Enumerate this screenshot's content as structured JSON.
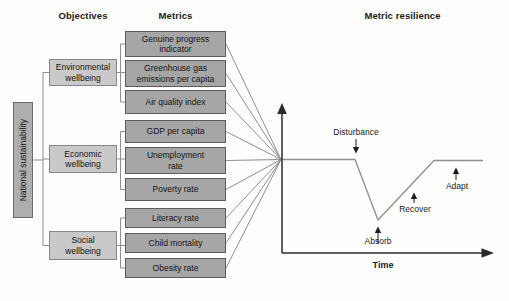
{
  "headers": {
    "objectives": "Objectives",
    "metrics": "Metrics",
    "resilience": "Metric resilience"
  },
  "root": {
    "label": "National sustainability"
  },
  "objectives": [
    {
      "label": "Environmental\nwellbeing",
      "metrics": [
        "Genuine progress\nindicator",
        "Greenhouse gas\nemissions per capita",
        "Air quality index"
      ]
    },
    {
      "label": "Economic\nwellbeing",
      "metrics": [
        "GDP per capita",
        "Unemployment\nrate",
        "Poverty rate"
      ]
    },
    {
      "label": "Social\nwellbeing",
      "metrics": [
        "Literacy rate",
        "Child mortality",
        "Obesity rate"
      ]
    }
  ],
  "resilience_chart": {
    "type": "line",
    "title": "Metric resilience",
    "xlabel": "Time",
    "ylabel": "",
    "description": "Conceptual resilience curve: metric holds steady, dips after a disturbance, then recovers and adapts back to its original level",
    "phases": [
      "Disturbance",
      "Absorb",
      "Recover",
      "Adapt"
    ],
    "labels": {
      "disturbance": "Disturbance",
      "absorb": "Absorb",
      "recover": "Recover",
      "adapt": "Adapt",
      "time": "Time"
    },
    "curve_shape": [
      {
        "phase": "steady",
        "level": "baseline"
      },
      {
        "phase": "disturbance",
        "level": "baseline"
      },
      {
        "phase": "absorb",
        "level": "minimum"
      },
      {
        "phase": "recover",
        "level": "rising"
      },
      {
        "phase": "adapt",
        "level": "baseline"
      }
    ]
  },
  "colors": {
    "metric_fill": "#a6a6a6",
    "metric_border": "#5d5d5d",
    "objective_fill": "#c9c9c9",
    "objective_border": "#878787",
    "root_fill": "#aeaeae",
    "connector_gray": "#8f8f8f",
    "axis_black": "#2a2a2a"
  }
}
